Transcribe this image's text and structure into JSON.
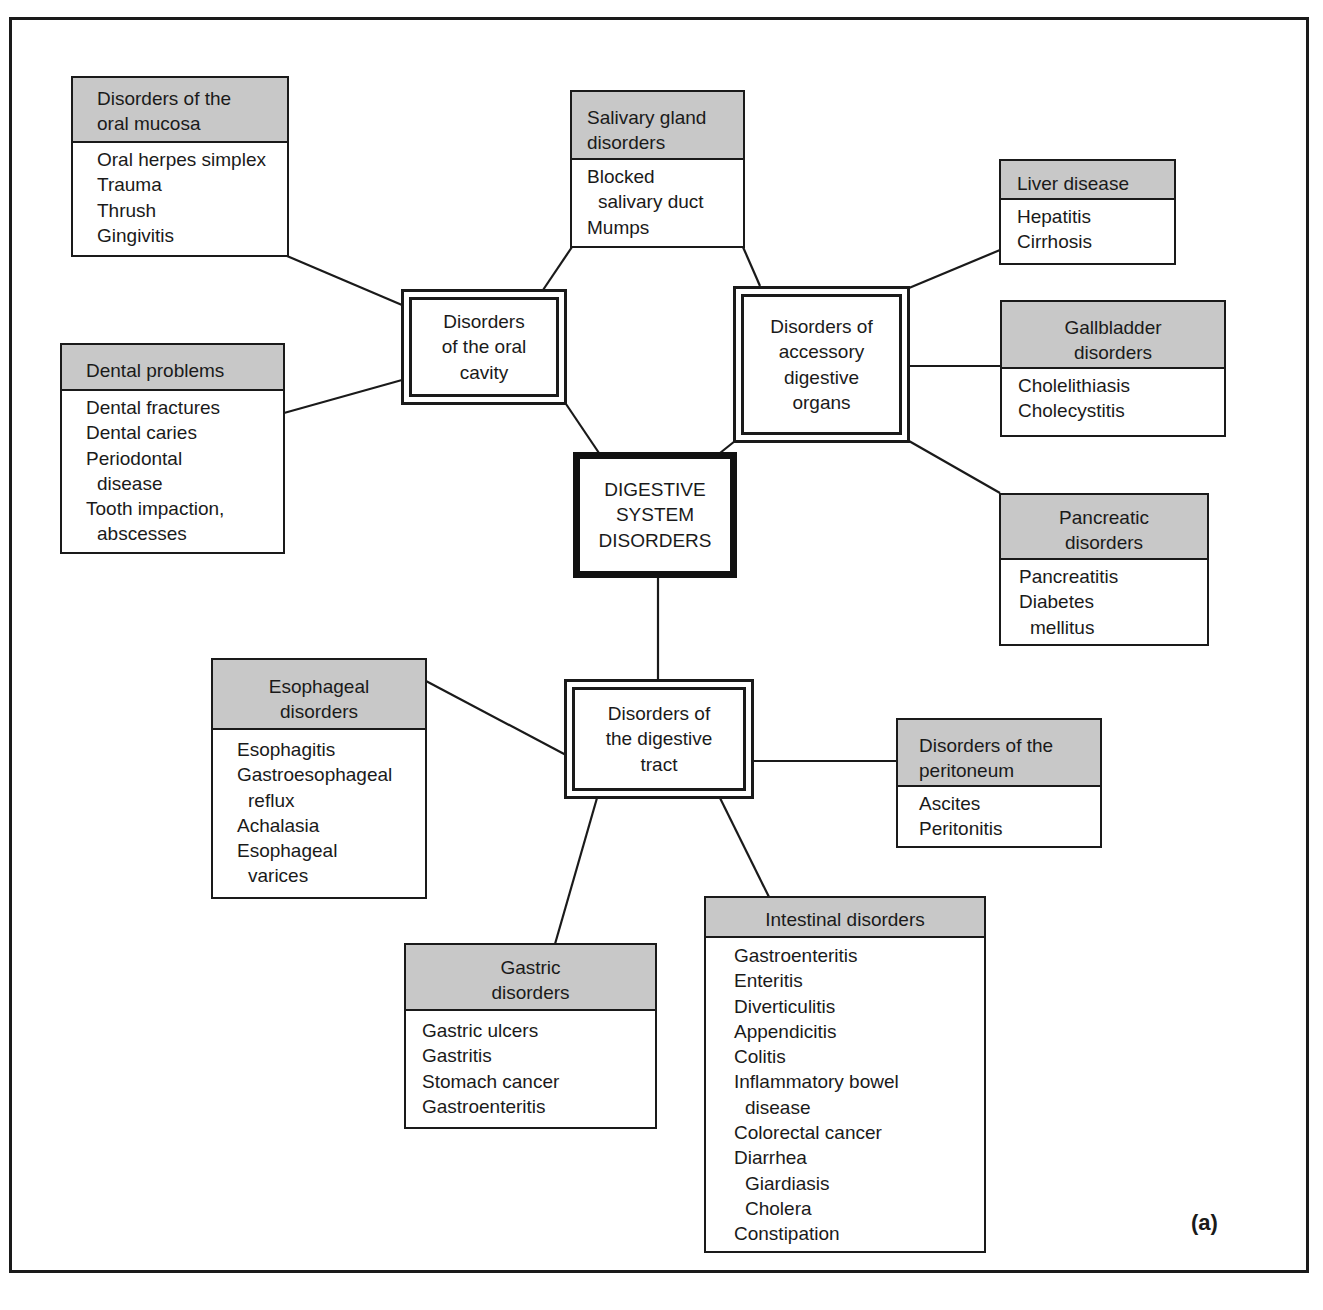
{
  "diagram": {
    "center": {
      "label": "DIGESTIVE\nSYSTEM\nDISORDERS"
    },
    "figure_label": "(a)",
    "hubs": {
      "oral_cavity": {
        "label": "Disorders\nof the oral\ncavity"
      },
      "accessory": {
        "label": "Disorders of\naccessory\ndigestive\norgans"
      },
      "digestive_tract": {
        "label": "Disorders of\nthe digestive\ntract"
      }
    },
    "categories": {
      "oral_mucosa": {
        "title": "Disorders of the\n oral mucosa",
        "items": [
          "Oral herpes simplex",
          "Trauma",
          "Thrush",
          "Gingivitis"
        ]
      },
      "dental": {
        "title": "Dental problems",
        "items": [
          "Dental fractures",
          "Dental caries",
          "Periodontal",
          "disease",
          "Tooth impaction,",
          "abscesses"
        ]
      },
      "salivary": {
        "title": "Salivary gland\n disorders",
        "items": [
          "Blocked",
          "salivary duct",
          "Mumps"
        ]
      },
      "liver": {
        "title": "Liver disease",
        "items": [
          "Hepatitis",
          "Cirrhosis"
        ]
      },
      "gallbladder": {
        "title": "Gallbladder\ndisorders",
        "items": [
          "Cholelithiasis",
          "Cholecystitis"
        ]
      },
      "pancreatic": {
        "title": "Pancreatic\ndisorders",
        "items": [
          "Pancreatitis",
          "Diabetes",
          "mellitus"
        ]
      },
      "esophageal": {
        "title": "Esophageal\ndisorders",
        "items": [
          "Esophagitis",
          "Gastroesophageal",
          "reflux",
          "Achalasia",
          "Esophageal",
          "varices"
        ]
      },
      "peritoneum": {
        "title": "Disorders of the\n peritoneum",
        "items": [
          "Ascites",
          "Peritonitis"
        ]
      },
      "gastric": {
        "title": "Gastric\ndisorders",
        "items": [
          "Gastric ulcers",
          "Gastritis",
          "Stomach cancer",
          "Gastroenteritis"
        ]
      },
      "intestinal": {
        "title": "Intestinal disorders",
        "items": [
          "Gastroenteritis",
          "Enteritis",
          "Diverticulitis",
          "Appendicitis",
          "Colitis",
          "Inflammatory bowel",
          "disease",
          "Colorectal cancer",
          "Diarrhea",
          "Giardiasis",
          "Cholera",
          "Constipation"
        ]
      }
    },
    "colors": {
      "header_fill": "#c8c8c8",
      "line": "#1a1a1a",
      "background": "#ffffff"
    }
  }
}
